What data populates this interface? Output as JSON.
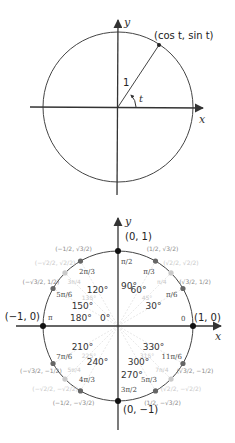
{
  "top_diagram": {
    "axis_x_label": "x",
    "axis_y_label": "y",
    "point_label": "(cos t, sin t)",
    "radius_label": "1",
    "angle_label": "t",
    "center": [
      118,
      107
    ],
    "radius": 75,
    "angle_deg": 57
  },
  "bottom_diagram": {
    "axis_x_label": "x",
    "axis_y_label": "y",
    "center": [
      118,
      326
    ],
    "radius": 75,
    "cardinal_points": [
      {
        "coord": "(1, 0)",
        "degree": "0°",
        "radian": "0"
      },
      {
        "coord": "(0, 1)",
        "degree": "90°",
        "radian": "π/2"
      },
      {
        "coord": "(−1, 0)",
        "degree": "180°",
        "radian": "π"
      },
      {
        "coord": "(0, −1)",
        "degree": "270°",
        "radian": "3π/2"
      }
    ],
    "angles": [
      {
        "deg": 30,
        "degree": "30°",
        "radian": "π/6",
        "coord": "(√3/2, 1/2)"
      },
      {
        "deg": 45,
        "degree": "45°",
        "radian": "π/4",
        "coord": "(√2/2, √2/2)"
      },
      {
        "deg": 60,
        "degree": "60°",
        "radian": "π/3",
        "coord": "(1/2, √3/2)"
      },
      {
        "deg": 120,
        "degree": "120°",
        "radian": "2π/3",
        "coord": "(−1/2, √3/2)"
      },
      {
        "deg": 135,
        "degree": "135°",
        "radian": "3π/4",
        "coord": "(−√2/2, √2/2)"
      },
      {
        "deg": 150,
        "degree": "150°",
        "radian": "5π/6",
        "coord": "(−√3/2, 1/2)"
      },
      {
        "deg": 210,
        "degree": "210°",
        "radian": "7π/6",
        "coord": "(−√3/2, −1/2)"
      },
      {
        "deg": 225,
        "degree": "225°",
        "radian": "5π/4",
        "coord": "(−√2/2, −√2/2)"
      },
      {
        "deg": 240,
        "degree": "240°",
        "radian": "4π/3",
        "coord": "(−1/2, −√3/2)"
      },
      {
        "deg": 300,
        "degree": "300°",
        "radian": "5π/3",
        "coord": "(1/2, −√3/2)"
      },
      {
        "deg": 315,
        "degree": "315°",
        "radian": "7π/4",
        "coord": "(√2/2, −√2/2)"
      },
      {
        "deg": 330,
        "degree": "330°",
        "radian": "11π/6",
        "coord": "(√3/2, −1/2)"
      }
    ]
  }
}
